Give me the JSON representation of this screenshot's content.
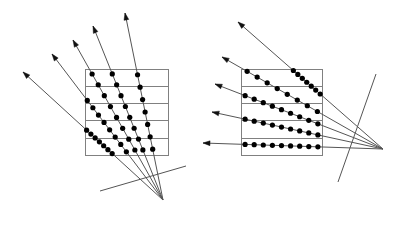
{
  "figure": {
    "background_color": "#ffffff",
    "stroke_color": "#555555",
    "dot_color": "#000000",
    "box_stroke_color": "#808080",
    "width": 408,
    "height": 231
  },
  "panels": [
    {
      "id": "left-panel",
      "name": "steep-fan-beam-panel",
      "grid": {
        "name": "pixel-grid-left",
        "x": 85,
        "y": 69,
        "w": 83,
        "h": 86,
        "rows": 5,
        "cols": 1,
        "row_line_ys": [
          86,
          103,
          120,
          138
        ]
      },
      "source": {
        "name": "fan-beam-source-left",
        "x": 163,
        "y": 200
      },
      "detector_line": {
        "name": "detector-line-left",
        "x1": 100,
        "y1": 191,
        "x2": 186,
        "y2": 166
      },
      "rays": [
        {
          "tip_x": 23,
          "tip_y": 72,
          "dots": 7
        },
        {
          "tip_x": 52,
          "tip_y": 54,
          "dots": 8
        },
        {
          "tip_x": 73,
          "tip_y": 40,
          "dots": 8
        },
        {
          "tip_x": 93,
          "tip_y": 26,
          "dots": 8
        },
        {
          "tip_x": 125,
          "tip_y": 13,
          "dots": 7
        }
      ],
      "ray_count": 5,
      "arrowhead": "up-left"
    },
    {
      "id": "right-panel",
      "name": "shallow-fan-beam-panel",
      "grid": {
        "name": "pixel-grid-right",
        "x": 241,
        "y": 69,
        "w": 81,
        "h": 86,
        "rows": 5,
        "cols": 1,
        "row_line_ys": [
          86,
          103,
          120,
          138
        ]
      },
      "source": {
        "name": "fan-beam-source-right",
        "x": 383,
        "y": 149
      },
      "detector_line": {
        "name": "detector-line-right",
        "x1": 376,
        "y1": 74,
        "x2": 338,
        "y2": 182
      },
      "rays": [
        {
          "tip_x": 203,
          "tip_y": 143,
          "dots": 9
        },
        {
          "tip_x": 212,
          "tip_y": 112,
          "dots": 9
        },
        {
          "tip_x": 215,
          "tip_y": 84,
          "dots": 9
        },
        {
          "tip_x": 222,
          "tip_y": 57,
          "dots": 8
        },
        {
          "tip_x": 238,
          "tip_y": 22,
          "dots": 7
        }
      ],
      "ray_count": 5,
      "arrowhead": "left"
    }
  ],
  "labels": {
    "left_caption": "",
    "right_caption": ""
  }
}
